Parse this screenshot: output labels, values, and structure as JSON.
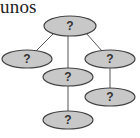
{
  "caption": "unos",
  "tree": {
    "nodes": [
      {
        "id": "root",
        "label": "?",
        "cx": 70,
        "cy": 26,
        "rx": 26,
        "ry": 10
      },
      {
        "id": "left",
        "label": "?",
        "cx": 27,
        "cy": 59,
        "rx": 25,
        "ry": 9
      },
      {
        "id": "middle",
        "label": "?",
        "cx": 68,
        "cy": 77,
        "rx": 25,
        "ry": 9
      },
      {
        "id": "right",
        "label": "?",
        "cx": 110,
        "cy": 59,
        "rx": 25,
        "ry": 9
      },
      {
        "id": "right-child",
        "label": "?",
        "cx": 110,
        "cy": 97,
        "rx": 25,
        "ry": 9
      },
      {
        "id": "middle-child",
        "label": "?",
        "cx": 68,
        "cy": 120,
        "rx": 25,
        "ry": 9
      }
    ],
    "edges": [
      {
        "from": "root",
        "to": "left"
      },
      {
        "from": "root",
        "to": "middle"
      },
      {
        "from": "root",
        "to": "right"
      },
      {
        "from": "middle",
        "to": "middle-child"
      },
      {
        "from": "right",
        "to": "right-child"
      }
    ],
    "colors": {
      "node_fill": "#c8c8c8",
      "node_stroke": "#444444",
      "edge": "#555555"
    }
  }
}
